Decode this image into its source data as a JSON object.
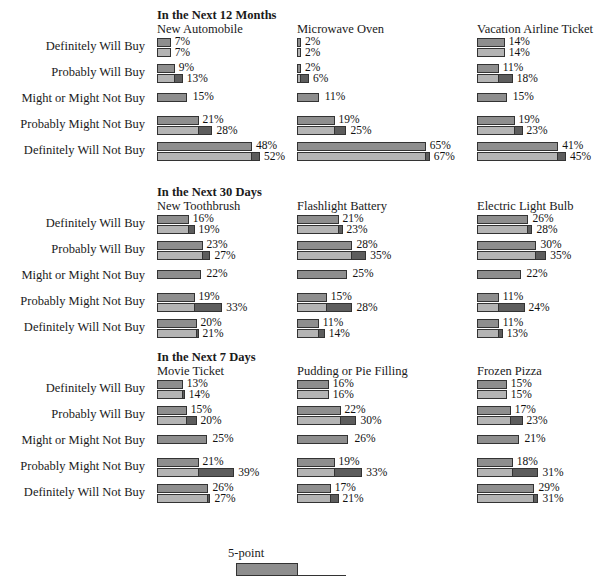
{
  "chart_data": {
    "type": "bar",
    "title": "",
    "xlabel": "",
    "ylabel": "",
    "orientation": "horizontal",
    "grid": false,
    "legend_position": "bottom",
    "value_suffix": "%",
    "xlim": [
      0,
      70
    ],
    "categories": [
      "Definitely Will Buy",
      "Probably Will Buy",
      "Might or Might Not Buy",
      "Probably Might Not Buy",
      "Definitely Will Not Buy"
    ],
    "series_names": [
      "5-point",
      "11-point"
    ],
    "sections": [
      {
        "heading": "In the Next 12 Months",
        "panels": [
          {
            "title": "New Automobile",
            "rows": [
              {
                "category": "Definitely Will Buy",
                "top": 7,
                "bottom": 7,
                "top_label": "7%",
                "bottom_label": "7%"
              },
              {
                "category": "Probably Will Buy",
                "top": 9,
                "bottom": 13,
                "top_label": "9%",
                "bottom_label": "13%"
              },
              {
                "category": "Might or Might Not Buy",
                "top": 15,
                "bottom": null,
                "top_label": "15%",
                "bottom_label": ""
              },
              {
                "category": "Probably Might Not Buy",
                "top": 21,
                "bottom": 28,
                "top_label": "21%",
                "bottom_label": "28%"
              },
              {
                "category": "Definitely Will Not Buy",
                "top": 48,
                "bottom": 52,
                "top_label": "48%",
                "bottom_label": "52%"
              }
            ]
          },
          {
            "title": "Microwave Oven",
            "rows": [
              {
                "category": "Definitely Will Buy",
                "top": 2,
                "bottom": 2,
                "top_label": "2%",
                "bottom_label": "2%"
              },
              {
                "category": "Probably Will Buy",
                "top": 2,
                "bottom": 6,
                "top_label": "2%",
                "bottom_label": "6%"
              },
              {
                "category": "Might or Might Not Buy",
                "top": 11,
                "bottom": null,
                "top_label": "11%",
                "bottom_label": ""
              },
              {
                "category": "Probably Might Not Buy",
                "top": 19,
                "bottom": 25,
                "top_label": "19%",
                "bottom_label": "25%"
              },
              {
                "category": "Definitely Will Not Buy",
                "top": 65,
                "bottom": 67,
                "top_label": "65%",
                "bottom_label": "67%"
              }
            ]
          },
          {
            "title": "Vacation Airline Ticket",
            "rows": [
              {
                "category": "Definitely Will Buy",
                "top": 14,
                "bottom": 14,
                "top_label": "14%",
                "bottom_label": "14%"
              },
              {
                "category": "Probably Will Buy",
                "top": 11,
                "bottom": 18,
                "top_label": "11%",
                "bottom_label": "18%"
              },
              {
                "category": "Might or Might Not Buy",
                "top": 15,
                "bottom": null,
                "top_label": "15%",
                "bottom_label": ""
              },
              {
                "category": "Probably Might Not Buy",
                "top": 19,
                "bottom": 23,
                "top_label": "19%",
                "bottom_label": "23%"
              },
              {
                "category": "Definitely Will Not Buy",
                "top": 41,
                "bottom": 45,
                "top_label": "41%",
                "bottom_label": "45%"
              }
            ]
          }
        ]
      },
      {
        "heading": "In the Next 30 Days",
        "panels": [
          {
            "title": "New Toothbrush",
            "rows": [
              {
                "category": "Definitely Will Buy",
                "top": 16,
                "bottom": 19,
                "top_label": "16%",
                "bottom_label": "19%"
              },
              {
                "category": "Probably Will Buy",
                "top": 23,
                "bottom": 27,
                "top_label": "23%",
                "bottom_label": "27%"
              },
              {
                "category": "Might or Might Not Buy",
                "top": 22,
                "bottom": null,
                "top_label": "22%",
                "bottom_label": ""
              },
              {
                "category": "Probably Might Not Buy",
                "top": 19,
                "bottom": 33,
                "top_label": "19%",
                "bottom_label": "33%"
              },
              {
                "category": "Definitely Will Not Buy",
                "top": 20,
                "bottom": 21,
                "top_label": "20%",
                "bottom_label": "21%"
              }
            ]
          },
          {
            "title": "Flashlight Battery",
            "rows": [
              {
                "category": "Definitely Will Buy",
                "top": 21,
                "bottom": 23,
                "top_label": "21%",
                "bottom_label": "23%"
              },
              {
                "category": "Probably Will Buy",
                "top": 28,
                "bottom": 35,
                "top_label": "28%",
                "bottom_label": "35%"
              },
              {
                "category": "Might or Might Not Buy",
                "top": 25,
                "bottom": null,
                "top_label": "25%",
                "bottom_label": ""
              },
              {
                "category": "Probably Might Not Buy",
                "top": 15,
                "bottom": 28,
                "top_label": "15%",
                "bottom_label": "28%"
              },
              {
                "category": "Definitely Will Not Buy",
                "top": 11,
                "bottom": 14,
                "top_label": "11%",
                "bottom_label": "14%"
              }
            ]
          },
          {
            "title": "Electric Light Bulb",
            "rows": [
              {
                "category": "Definitely Will Buy",
                "top": 26,
                "bottom": 28,
                "top_label": "26%",
                "bottom_label": "28%"
              },
              {
                "category": "Probably Will Buy",
                "top": 30,
                "bottom": 35,
                "top_label": "30%",
                "bottom_label": "35%"
              },
              {
                "category": "Might or Might Not Buy",
                "top": 22,
                "bottom": null,
                "top_label": "22%",
                "bottom_label": ""
              },
              {
                "category": "Probably Might Not Buy",
                "top": 11,
                "bottom": 24,
                "top_label": "11%",
                "bottom_label": "24%"
              },
              {
                "category": "Definitely Will Not Buy",
                "top": 11,
                "bottom": 13,
                "top_label": "11%",
                "bottom_label": "13%"
              }
            ]
          }
        ]
      },
      {
        "heading": "In the Next 7 Days",
        "panels": [
          {
            "title": "Movie Ticket",
            "rows": [
              {
                "category": "Definitely Will Buy",
                "top": 13,
                "bottom": 14,
                "top_label": "13%",
                "bottom_label": "14%"
              },
              {
                "category": "Probably Will Buy",
                "top": 15,
                "bottom": 20,
                "top_label": "15%",
                "bottom_label": "20%"
              },
              {
                "category": "Might or Might Not Buy",
                "top": 25,
                "bottom": null,
                "top_label": "25%",
                "bottom_label": ""
              },
              {
                "category": "Probably Might Not Buy",
                "top": 21,
                "bottom": 39,
                "top_label": "21%",
                "bottom_label": "39%"
              },
              {
                "category": "Definitely Will Not Buy",
                "top": 26,
                "bottom": 27,
                "top_label": "26%",
                "bottom_label": "27%"
              }
            ]
          },
          {
            "title": "Pudding or Pie Filling",
            "rows": [
              {
                "category": "Definitely Will Buy",
                "top": 16,
                "bottom": 16,
                "top_label": "16%",
                "bottom_label": "16%"
              },
              {
                "category": "Probably Will Buy",
                "top": 22,
                "bottom": 30,
                "top_label": "22%",
                "bottom_label": "30%"
              },
              {
                "category": "Might or Might Not Buy",
                "top": 26,
                "bottom": null,
                "top_label": "26%",
                "bottom_label": ""
              },
              {
                "category": "Probably Might Not Buy",
                "top": 19,
                "bottom": 33,
                "top_label": "19%",
                "bottom_label": "33%"
              },
              {
                "category": "Definitely Will Not Buy",
                "top": 17,
                "bottom": 21,
                "top_label": "17%",
                "bottom_label": "21%"
              }
            ]
          },
          {
            "title": "Frozen Pizza",
            "rows": [
              {
                "category": "Definitely Will Buy",
                "top": 15,
                "bottom": 15,
                "top_label": "15%",
                "bottom_label": "15%"
              },
              {
                "category": "Probably Will Buy",
                "top": 17,
                "bottom": 23,
                "top_label": "17%",
                "bottom_label": "23%"
              },
              {
                "category": "Might or Might Not Buy",
                "top": 21,
                "bottom": null,
                "top_label": "21%",
                "bottom_label": ""
              },
              {
                "category": "Probably Might Not Buy",
                "top": 18,
                "bottom": 31,
                "top_label": "18%",
                "bottom_label": "31%"
              },
              {
                "category": "Definitely Will Not Buy",
                "top": 29,
                "bottom": 31,
                "top_label": "29%",
                "bottom_label": "31%"
              }
            ]
          }
        ]
      }
    ],
    "legend": {
      "label": "5-point"
    },
    "colors": {
      "bar_top": "#8e8e8e",
      "bar_bottom": "#b4b4b4",
      "bar_extension": "#5d5d5d",
      "outline": "#333333",
      "background": "#ffffff",
      "text": "#1a1a1a"
    }
  }
}
